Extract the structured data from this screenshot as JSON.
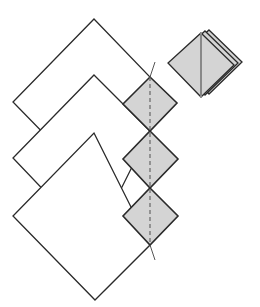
{
  "caption": {
    "text": "",
    "note": "top caption clipped; only descenders visible"
  },
  "colors": {
    "stroke": "#2a2a2a",
    "fill_small": "#d4d4d4",
    "fill_large": "#ffffff",
    "dashed": "#666666",
    "background": "#ffffff"
  },
  "diagram": {
    "large_squares": [
      {
        "id": "large-1",
        "top": [
          94,
          19
        ],
        "left": [
          13,
          102
        ],
        "bottom": [
          94,
          185
        ],
        "right": [
          150,
          77
        ]
      },
      {
        "id": "large-2",
        "top": [
          94,
          75
        ],
        "left": [
          13,
          158
        ],
        "bottom": [
          94,
          243
        ],
        "right": [
          150,
          131
        ]
      },
      {
        "id": "large-3",
        "top": [
          94,
          133
        ],
        "left": [
          13,
          216
        ],
        "bottom": [
          95,
          300
        ],
        "right": [
          150,
          245
        ]
      }
    ],
    "small_squares": [
      {
        "id": "small-1",
        "top": [
          150,
          77
        ],
        "left": [
          123,
          104
        ],
        "bottom": [
          150,
          131
        ],
        "right": [
          177,
          103
        ]
      },
      {
        "id": "small-2",
        "top": [
          150,
          131
        ],
        "left": [
          123,
          159
        ],
        "bottom": [
          150,
          188
        ],
        "right": [
          178,
          159
        ]
      },
      {
        "id": "small-3",
        "top": [
          150,
          188
        ],
        "left": [
          123,
          216
        ],
        "bottom": [
          150,
          245
        ],
        "right": [
          178,
          216
        ]
      }
    ],
    "fold_line": {
      "from": [
        150,
        77
      ],
      "to": [
        150,
        245
      ],
      "style": "dashed"
    },
    "cut_line": {
      "segments": [
        [
          [
            155,
            62
          ],
          [
            150,
            77
          ]
        ],
        [
          [
            150,
            245
          ],
          [
            155,
            260
          ]
        ]
      ]
    },
    "stacked_result": {
      "layers": 3,
      "front": {
        "top": [
          201,
          33
        ],
        "left": [
          168,
          63
        ],
        "bottom": [
          201,
          97
        ],
        "right": [
          234,
          65
        ]
      },
      "offsets": [
        [
          0,
          0
        ],
        [
          4,
          -2
        ],
        [
          8,
          -3
        ]
      ],
      "center_crease": true
    }
  }
}
